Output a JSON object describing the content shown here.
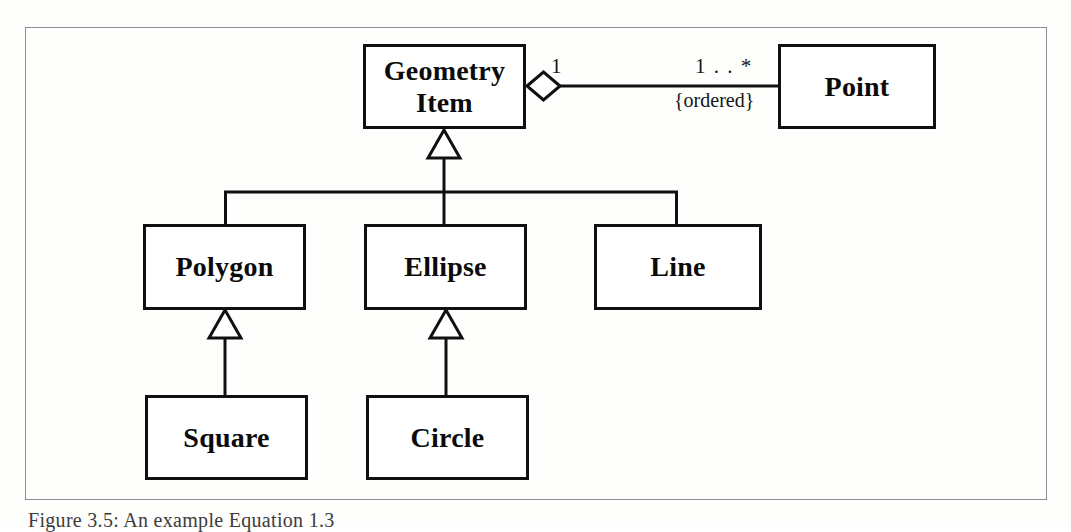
{
  "figure": {
    "caption": "Figure 3.5:  An example Equation 1.3",
    "frame": {
      "border_color": "#8d8d8d"
    }
  },
  "diagram": {
    "type": "uml-class-diagram",
    "line_color": "#101010",
    "box_fill": "#ffffff",
    "classes": [
      {
        "id": "geometry-item",
        "name": "Geometry\nItem",
        "name_lines": [
          "Geometry",
          "Item"
        ]
      },
      {
        "id": "point",
        "name": "Point",
        "name_lines": [
          "Point"
        ]
      },
      {
        "id": "polygon",
        "name": "Polygon",
        "name_lines": [
          "Polygon"
        ]
      },
      {
        "id": "ellipse",
        "name": "Ellipse",
        "name_lines": [
          "Ellipse"
        ]
      },
      {
        "id": "line",
        "name": "Line",
        "name_lines": [
          "Line"
        ]
      },
      {
        "id": "square",
        "name": "Square",
        "name_lines": [
          "Square"
        ]
      },
      {
        "id": "circle",
        "name": "Circle",
        "name_lines": [
          "Circle"
        ]
      }
    ],
    "associations": [
      {
        "id": "geometry-item-point",
        "kind": "aggregation",
        "source": "geometry-item",
        "target": "point",
        "source_multiplicity": "1",
        "target_multiplicity": "1 . . *",
        "constraint": "{ordered}",
        "diamond": "hollow"
      }
    ],
    "generalizations": [
      {
        "id": "polygon-to-geometry-item",
        "kind": "generalization",
        "subclass": "polygon",
        "superclass": "geometry-item"
      },
      {
        "id": "ellipse-to-geometry-item",
        "kind": "generalization",
        "subclass": "ellipse",
        "superclass": "geometry-item"
      },
      {
        "id": "line-to-geometry-item",
        "kind": "generalization",
        "subclass": "line",
        "superclass": "geometry-item"
      },
      {
        "id": "square-to-polygon",
        "kind": "generalization",
        "subclass": "square",
        "superclass": "polygon"
      },
      {
        "id": "circle-to-ellipse",
        "kind": "generalization",
        "subclass": "circle",
        "superclass": "ellipse"
      }
    ]
  },
  "labels": {
    "geometry_item_line1": "Geometry",
    "geometry_item_line2": "Item",
    "point": "Point",
    "polygon": "Polygon",
    "ellipse": "Ellipse",
    "line": "Line",
    "square": "Square",
    "circle": "Circle",
    "source_multiplicity": "1",
    "target_multiplicity": "1 . . *",
    "ordered_constraint": "{ordered}"
  }
}
